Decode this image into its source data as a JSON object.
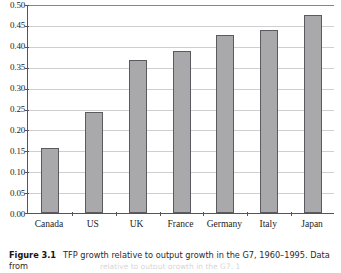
{
  "caption": {
    "figure_number": "Figure 3.1",
    "text": "TFP growth relative to output growth in the G7, 1960–1995. Data from",
    "bleed_fragment": "relative to output growth in the G7, 1"
  },
  "colors": {
    "bar_fill": "#a9a9ab",
    "bar_border": "#5b5a60",
    "gridline": "#cfcfd2",
    "axis": "#55545a",
    "background": "#ffffff",
    "text": "#1c1c1e"
  },
  "chart_data": {
    "type": "bar",
    "title": "",
    "xlabel": "",
    "ylabel": "",
    "categories": [
      "Canada",
      "US",
      "UK",
      "France",
      "Germany",
      "Italy",
      "Japan"
    ],
    "values": [
      0.155,
      0.241,
      0.365,
      0.387,
      0.426,
      0.437,
      0.473
    ],
    "ylim": [
      0.0,
      0.5
    ],
    "ytick_labels": [
      "0.50",
      "0.45",
      "0.40",
      "0.35",
      "0.30",
      "0.25",
      "0.20",
      "0.15",
      "0.10",
      "0.05",
      "0.00"
    ],
    "ytick_values": [
      0.5,
      0.45,
      0.4,
      0.35,
      0.3,
      0.25,
      0.2,
      0.15,
      0.1,
      0.05,
      0.0
    ],
    "ytick_step": 0.05,
    "grid": true,
    "legend": false,
    "legend_position": "none"
  }
}
